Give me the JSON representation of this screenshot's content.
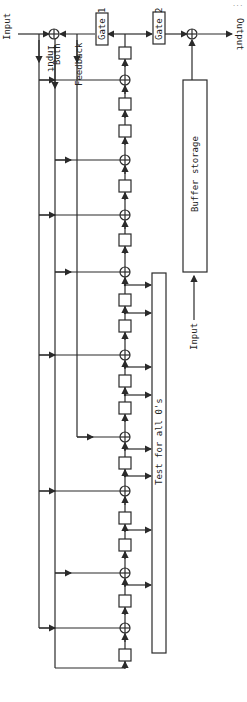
{
  "figure": {
    "corner_note": "...",
    "labels": {
      "input_main": "Input",
      "output": "Output",
      "gate1": "Gate 1",
      "gate2": "Gate 2",
      "line_input": "Input",
      "line_both": "Both",
      "line_feedback": "Feedback",
      "buffer": "Buffer storage",
      "buffer_input": "Input",
      "test_box": "Test for all 0's"
    },
    "chain": {
      "x": 125,
      "elements": [
        {
          "type": "delay",
          "y": 53
        },
        {
          "type": "xor",
          "y": 80,
          "tap": "input"
        },
        {
          "type": "delay",
          "y": 104
        },
        {
          "type": "delay",
          "y": 131
        },
        {
          "type": "xor",
          "y": 160,
          "tap": "both"
        },
        {
          "type": "delay",
          "y": 186
        },
        {
          "type": "xor",
          "y": 215,
          "tap": "input"
        },
        {
          "type": "delay",
          "y": 240
        },
        {
          "type": "xor",
          "y": 272,
          "tap": "both"
        },
        {
          "type": "delay",
          "y": 300
        },
        {
          "type": "delay",
          "y": 326
        },
        {
          "type": "xor",
          "y": 355,
          "tap": "input"
        },
        {
          "type": "delay",
          "y": 381
        },
        {
          "type": "delay",
          "y": 408
        },
        {
          "type": "xor",
          "y": 437,
          "tap": "feedback"
        },
        {
          "type": "delay",
          "y": 463
        },
        {
          "type": "xor",
          "y": 491,
          "tap": "input"
        },
        {
          "type": "delay",
          "y": 518
        },
        {
          "type": "delay",
          "y": 545
        },
        {
          "type": "xor",
          "y": 573,
          "tap": "both"
        },
        {
          "type": "delay",
          "y": 601
        },
        {
          "type": "xor",
          "y": 628,
          "tap": "input"
        },
        {
          "type": "delay",
          "y": 655
        }
      ],
      "test_taps_y": [
        285,
        313,
        367,
        395,
        449,
        476,
        530,
        585
      ]
    },
    "colors": {
      "line": "#2a2a2a",
      "background": "#ffffff",
      "text": "#222222"
    }
  }
}
